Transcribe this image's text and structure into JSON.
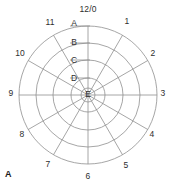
{
  "figure": {
    "caption": "A",
    "type": "polar-grid",
    "background_color": "#ffffff",
    "line_color": "#8f8f8f",
    "text_color": "#2e2e2e"
  },
  "chart_data": {
    "type": "polar-grid",
    "title": "",
    "subtitle": "",
    "xlabel": "",
    "ylabel": "",
    "grid": true,
    "legend": "none",
    "center": {
      "x": 88,
      "y": 95
    },
    "outer_radius": 69,
    "spoke_count": 12,
    "ring_count": 5,
    "angular_axis": {
      "name": "clock-hours",
      "direction": "clockwise",
      "start_angle_deg": 0,
      "step_deg": 30,
      "tick_labels": [
        "12/0",
        "1",
        "2",
        "3",
        "4",
        "5",
        "6",
        "7",
        "8",
        "9",
        "10",
        "11"
      ]
    },
    "radial_axis": {
      "name": "rings",
      "direction": "outer-to-inner",
      "tick_labels": [
        "A",
        "B",
        "C",
        "D",
        "E"
      ],
      "radii": [
        69,
        52,
        35,
        17,
        7
      ]
    },
    "rings": [
      {
        "label": "A",
        "radius": 69,
        "label_y": 23
      },
      {
        "label": "B",
        "radius": 52,
        "label_y": 42
      },
      {
        "label": "C",
        "radius": 35,
        "label_y": 60
      },
      {
        "label": "D",
        "radius": 17,
        "label_y": 78
      },
      {
        "label": "E",
        "radius": 7,
        "label_y": 94
      }
    ],
    "spokes": [
      {
        "label": "12/0",
        "angle_deg": 0,
        "label_x": 88,
        "label_y": 9,
        "align": "center"
      },
      {
        "label": "1",
        "angle_deg": 30,
        "label_x": 127,
        "label_y": 21,
        "align": "center"
      },
      {
        "label": "2",
        "angle_deg": 60,
        "label_x": 153,
        "label_y": 53,
        "align": "center"
      },
      {
        "label": "3",
        "angle_deg": 90,
        "label_x": 163,
        "label_y": 93,
        "align": "center"
      },
      {
        "label": "4",
        "angle_deg": 120,
        "label_x": 152,
        "label_y": 134,
        "align": "center"
      },
      {
        "label": "5",
        "angle_deg": 150,
        "label_x": 126,
        "label_y": 165,
        "align": "center"
      },
      {
        "label": "6",
        "angle_deg": 180,
        "label_x": 88,
        "label_y": 176,
        "align": "center"
      },
      {
        "label": "7",
        "angle_deg": 210,
        "label_x": 48,
        "label_y": 164,
        "align": "center"
      },
      {
        "label": "8",
        "angle_deg": 240,
        "label_x": 22,
        "label_y": 134,
        "align": "center"
      },
      {
        "label": "9",
        "angle_deg": 270,
        "label_x": 11,
        "label_y": 93,
        "align": "center"
      },
      {
        "label": "10",
        "angle_deg": 300,
        "label_x": 20,
        "label_y": 53,
        "align": "center"
      },
      {
        "label": "11",
        "angle_deg": 330,
        "label_x": 50,
        "label_y": 22,
        "align": "center"
      }
    ]
  }
}
